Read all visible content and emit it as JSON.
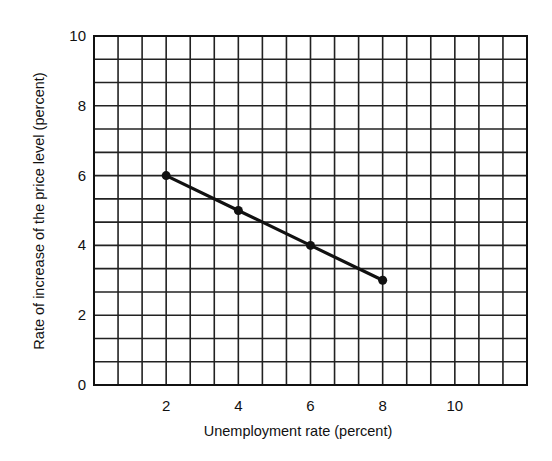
{
  "chart_data": {
    "type": "line",
    "title": "",
    "xlabel": "Unemployment rate (percent)",
    "ylabel": "Rate of increase of the price level (percent)",
    "xlim": [
      0,
      12
    ],
    "ylim": [
      0,
      10
    ],
    "x_ticks": [
      2,
      4,
      6,
      8,
      10
    ],
    "y_ticks": [
      0,
      2,
      4,
      6,
      8,
      10
    ],
    "grid": true,
    "grid_step": 0.6667,
    "legend": null,
    "series": [
      {
        "name": "Phillips curve",
        "x": [
          2,
          4,
          6,
          8
        ],
        "y": [
          6,
          5,
          4,
          3
        ],
        "color": "#111111",
        "markers": true
      }
    ]
  }
}
